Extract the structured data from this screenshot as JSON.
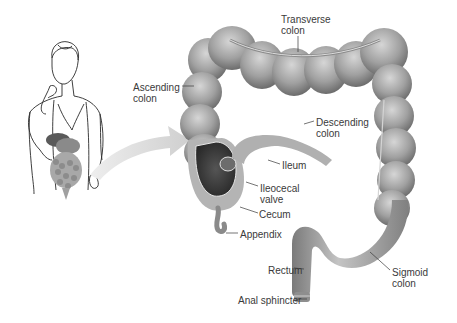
{
  "diagram": {
    "colors": {
      "background": "#ffffff",
      "colon_fill": "#9a9a9a",
      "colon_highlight": "#c8c8c8",
      "colon_shadow": "#6e6e6e",
      "interior_dark": "#3c3c3c",
      "label_text": "#3a3a3a",
      "arrow_fill": "#d4d4d4",
      "figure_line": "#2a2a2a"
    },
    "labels": [
      {
        "id": "transverse-colon",
        "text": "Transverse\ncolon",
        "x": 281,
        "y": 14
      },
      {
        "id": "ascending-colon",
        "text": "Ascending\ncolon",
        "x": 133,
        "y": 82
      },
      {
        "id": "descending-colon",
        "text": "Descending\ncolon",
        "x": 316,
        "y": 117
      },
      {
        "id": "ileum",
        "text": "Ileum",
        "x": 282,
        "y": 160
      },
      {
        "id": "ileocecal-valve",
        "text": "Ileocecal\nvalve",
        "x": 260,
        "y": 183
      },
      {
        "id": "cecum",
        "text": "Cecum",
        "x": 259,
        "y": 209
      },
      {
        "id": "appendix",
        "text": "Appendix",
        "x": 240,
        "y": 229
      },
      {
        "id": "rectum",
        "text": "Rectum",
        "x": 268,
        "y": 265
      },
      {
        "id": "anal-sphincter",
        "text": "Anal sphincter",
        "x": 238,
        "y": 295
      },
      {
        "id": "sigmoid-colon",
        "text": "Sigmoid\ncolon",
        "x": 392,
        "y": 267
      }
    ],
    "figure": {
      "description": "Line drawing of a woman with digestive organs shown"
    }
  }
}
